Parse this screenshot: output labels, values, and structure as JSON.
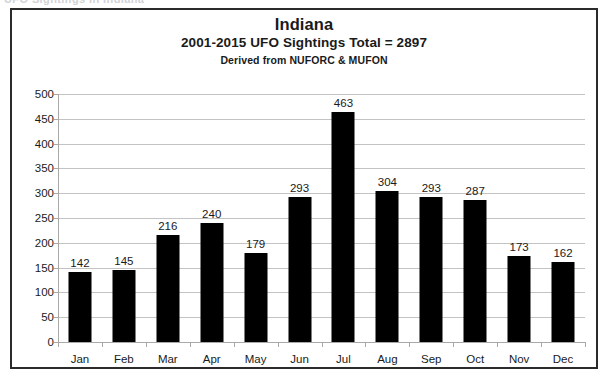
{
  "top_cut_text": "UFO Sightings in Indiana",
  "chart_data": {
    "type": "bar",
    "title": "Indiana",
    "subtitle": "2001-2015 UFO Sightings Total = 2897",
    "source_note": "Derived from NUFORC & MUFON",
    "categories": [
      "Jan",
      "Feb",
      "Mar",
      "Apr",
      "May",
      "Jun",
      "Jul",
      "Aug",
      "Sep",
      "Oct",
      "Nov",
      "Dec"
    ],
    "values": [
      142,
      145,
      216,
      240,
      179,
      293,
      463,
      304,
      293,
      287,
      173,
      162
    ],
    "total": 2897,
    "xlabel": "",
    "ylabel": "",
    "ylim": [
      0,
      500
    ],
    "ytick_step": 50,
    "yticks": [
      500,
      450,
      400,
      350,
      300,
      250,
      200,
      150,
      100,
      50,
      0
    ],
    "ytick_labels": [
      "500",
      "450",
      "400",
      "350",
      "300",
      "250",
      "200",
      "150",
      "100",
      "50",
      "0"
    ],
    "grid": true,
    "legend": false,
    "bar_color": "#000000",
    "gridline_color": "#c3c3c3",
    "axis_color": "#a9a9a9",
    "text_color": "#1a1a1a",
    "border_color": "#2b2b2b",
    "background_color": "#ffffff",
    "data_labels": true
  }
}
